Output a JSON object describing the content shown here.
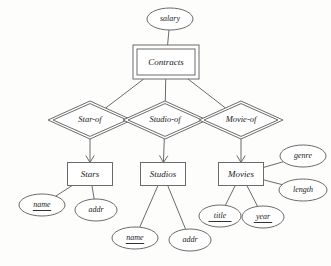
{
  "diagram": {
    "type": "entity-relationship-diagram",
    "notation": "Chen",
    "background_color": "#fdfdfc",
    "line_color": "#6b6b6b",
    "text_color": "#1a1a1a"
  },
  "entities": [
    {
      "id": "contracts",
      "label": "Contracts",
      "kind": "weak-entity-set",
      "border": "double",
      "x": 166,
      "y": 62,
      "w": 66,
      "h": 34
    },
    {
      "id": "stars",
      "label": "Stars",
      "kind": "entity-set",
      "border": "single",
      "x": 90,
      "y": 174,
      "w": 45,
      "h": 23
    },
    {
      "id": "studios",
      "label": "Studios",
      "kind": "entity-set",
      "border": "single",
      "x": 163,
      "y": 174,
      "w": 45,
      "h": 23
    },
    {
      "id": "movies",
      "label": "Movies",
      "kind": "entity-set",
      "border": "single",
      "x": 241,
      "y": 174,
      "w": 45,
      "h": 23
    }
  ],
  "relationships": [
    {
      "id": "star-of",
      "label": "Star-of",
      "kind": "supporting-relationship",
      "border": "double",
      "x": 90,
      "y": 120,
      "rx": 42,
      "ry": 19
    },
    {
      "id": "studio-of",
      "label": "Studio-of",
      "kind": "supporting-relationship",
      "border": "double",
      "x": 165,
      "y": 120,
      "rx": 42,
      "ry": 19
    },
    {
      "id": "movie-of",
      "label": "Movie-of",
      "kind": "supporting-relationship",
      "border": "double",
      "x": 241,
      "y": 120,
      "rx": 42,
      "ry": 19
    }
  ],
  "attributes": [
    {
      "id": "salary",
      "label": "salary",
      "owner": "contracts",
      "key": false,
      "x": 170,
      "y": 19,
      "rx": 23,
      "ry": 11
    },
    {
      "id": "stars-name",
      "label": "name",
      "owner": "stars",
      "key": true,
      "x": 42,
      "y": 205,
      "rx": 23,
      "ry": 11
    },
    {
      "id": "stars-addr",
      "label": "addr",
      "owner": "stars",
      "key": false,
      "x": 96,
      "y": 210,
      "rx": 21,
      "ry": 11
    },
    {
      "id": "studios-name",
      "label": "name",
      "owner": "studios",
      "key": true,
      "x": 135,
      "y": 238,
      "rx": 23,
      "ry": 11
    },
    {
      "id": "studios-addr",
      "label": "addr",
      "owner": "studios",
      "key": false,
      "x": 190,
      "y": 240,
      "rx": 21,
      "ry": 11
    },
    {
      "id": "movies-title",
      "label": "title",
      "owner": "movies",
      "key": true,
      "x": 220,
      "y": 216,
      "rx": 21,
      "ry": 11
    },
    {
      "id": "movies-year",
      "label": "year",
      "owner": "movies",
      "key": true,
      "x": 263,
      "y": 217,
      "rx": 21,
      "ry": 11
    },
    {
      "id": "movies-genre",
      "label": "genre",
      "owner": "movies",
      "key": false,
      "x": 303,
      "y": 156,
      "rx": 23,
      "ry": 11
    },
    {
      "id": "movies-length",
      "label": "length",
      "owner": "movies",
      "key": false,
      "x": 303,
      "y": 190,
      "rx": 24,
      "ry": 11
    }
  ],
  "edges": [
    {
      "id": "salary-contracts",
      "from": "salary",
      "to": "contracts",
      "arrow": false
    },
    {
      "id": "contracts-star-of",
      "from": "contracts",
      "to": "star-of",
      "arrow": false
    },
    {
      "id": "contracts-studio-of",
      "from": "contracts",
      "to": "studio-of",
      "arrow": false
    },
    {
      "id": "contracts-movie-of",
      "from": "contracts",
      "to": "movie-of",
      "arrow": false
    },
    {
      "id": "star-of-stars",
      "from": "star-of",
      "to": "stars",
      "arrow": true
    },
    {
      "id": "studio-of-studios",
      "from": "studio-of",
      "to": "studios",
      "arrow": true
    },
    {
      "id": "movie-of-movies",
      "from": "movie-of",
      "to": "movies",
      "arrow": true
    },
    {
      "id": "stars-name-edge",
      "from": "stars",
      "to": "stars-name",
      "arrow": false
    },
    {
      "id": "stars-addr-edge",
      "from": "stars",
      "to": "stars-addr",
      "arrow": false
    },
    {
      "id": "studios-name-edge",
      "from": "studios",
      "to": "studios-name",
      "arrow": false
    },
    {
      "id": "studios-addr-edge",
      "from": "studios",
      "to": "studios-addr",
      "arrow": false
    },
    {
      "id": "movies-title-edge",
      "from": "movies",
      "to": "movies-title",
      "arrow": false
    },
    {
      "id": "movies-year-edge",
      "from": "movies",
      "to": "movies-year",
      "arrow": false
    },
    {
      "id": "movies-genre-edge",
      "from": "movies",
      "to": "movies-genre",
      "arrow": false
    },
    {
      "id": "movies-length-edge",
      "from": "movies",
      "to": "movies-length",
      "arrow": false
    }
  ]
}
